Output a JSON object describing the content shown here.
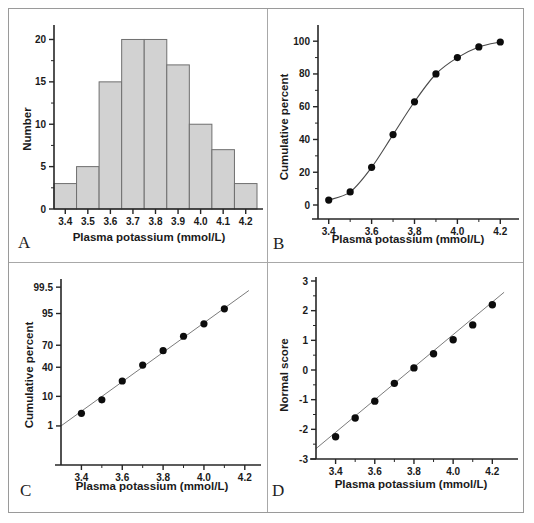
{
  "figure": {
    "panel_letters": [
      "A",
      "B",
      "C",
      "D"
    ],
    "shared_xlabel": "Plasma potassium (mmol/L)",
    "shared_xticks": [
      "3.4",
      "3.5",
      "3.6",
      "3.7",
      "3.8",
      "3.9",
      "4.0",
      "4.1",
      "4.2"
    ],
    "colors": {
      "bar_fill": "#d2d2d2",
      "bar_stroke": "#6f6f6f",
      "axis": "#262626",
      "marker": "#0c0c0c",
      "line": "#7b7b7b",
      "frame": "#9a9a9a"
    }
  },
  "chart_data": [
    {
      "panel": "A",
      "type": "bar",
      "title": "",
      "xlabel": "Plasma potassium (mmol/L)",
      "ylabel": "Number",
      "categories": [
        "3.4",
        "3.5",
        "3.6",
        "3.7",
        "3.8",
        "3.9",
        "4.0",
        "4.1",
        "4.2"
      ],
      "values": [
        3,
        5,
        15,
        20,
        20,
        17,
        10,
        7,
        3
      ],
      "xlim": [
        3.35,
        4.25
      ],
      "ylim": [
        0,
        21
      ],
      "yticks": [
        "0",
        "5",
        "10",
        "15",
        "20"
      ],
      "ytick_values": [
        0,
        5,
        10,
        15,
        20
      ],
      "xticks": [
        "3.4",
        "3.5",
        "3.6",
        "3.7",
        "3.8",
        "3.9",
        "4.0",
        "4.1",
        "4.2"
      ],
      "grid": false,
      "legend": "none"
    },
    {
      "panel": "B",
      "type": "line",
      "title": "",
      "xlabel": "Plasma potassium (mmol/L)",
      "ylabel": "Cumulative percent",
      "x": [
        3.4,
        3.5,
        3.6,
        3.7,
        3.8,
        3.9,
        4.0,
        4.1,
        4.2
      ],
      "values": [
        3,
        8,
        23,
        43,
        63,
        80,
        90,
        96.5,
        99.5
      ],
      "xlim": [
        3.35,
        4.25
      ],
      "ylim": [
        0,
        105
      ],
      "yticks": [
        "0",
        "20",
        "40",
        "60",
        "80",
        "100"
      ],
      "ytick_values": [
        0,
        20,
        40,
        60,
        80,
        100
      ],
      "xticks": [
        "3.4",
        "3.6",
        "3.8",
        "4.0",
        "4.2"
      ],
      "grid": false,
      "legend": "none",
      "annotation": "sigmoid cumulative distribution curve through markers"
    },
    {
      "panel": "C",
      "type": "scatter",
      "title": "",
      "xlabel": "Plasma potassium (mmol/L)",
      "ylabel": "Cumulative percent",
      "x": [
        3.4,
        3.5,
        3.6,
        3.7,
        3.8,
        3.9,
        4.0,
        4.1
      ],
      "values": [
        3,
        8,
        23,
        43,
        63,
        80,
        90,
        96.5
      ],
      "xlim": [
        3.3,
        4.25
      ],
      "yticks": [
        "1",
        "10",
        "40",
        "70",
        "95",
        "99.5"
      ],
      "ytick_values": [
        1,
        10,
        40,
        70,
        95,
        99.5
      ],
      "xticks": [
        "3.4",
        "3.6",
        "3.8",
        "4.0",
        "4.2"
      ],
      "yscale": "probability",
      "grid": false,
      "legend": "none",
      "annotation": "straight fitted line on normal probability scale"
    },
    {
      "panel": "D",
      "type": "scatter",
      "title": "",
      "xlabel": "Plasma potassium (mmol/L)",
      "ylabel": "Normal score",
      "x": [
        3.4,
        3.5,
        3.6,
        3.7,
        3.8,
        3.9,
        4.0,
        4.1,
        4.2
      ],
      "values": [
        -2.25,
        -1.62,
        -1.05,
        -0.45,
        0.07,
        0.55,
        1.02,
        1.52,
        2.2
      ],
      "xlim": [
        3.3,
        4.28
      ],
      "ylim": [
        -3,
        3
      ],
      "yticks": [
        "-3",
        "-2",
        "-1",
        "0",
        "1",
        "2",
        "3"
      ],
      "ytick_values": [
        -3,
        -2,
        -1,
        0,
        1,
        2,
        3
      ],
      "xticks": [
        "3.4",
        "3.6",
        "3.8",
        "4.0",
        "4.2"
      ],
      "grid": false,
      "legend": "none",
      "annotation": "straight fitted line through normal scores"
    }
  ]
}
